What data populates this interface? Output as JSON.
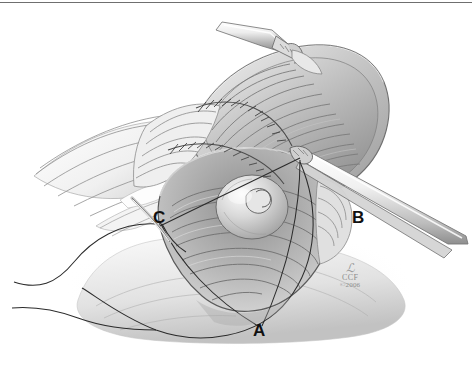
{
  "figure": {
    "style": "grayscale-line-and-wash",
    "background_color": "#ffffff",
    "ink_color": "#1a1a1a",
    "border": {
      "position": "top",
      "color": "#6f6f6f",
      "thickness_px": 1
    }
  },
  "annotations": [
    {
      "id": "A",
      "label": "A",
      "position": "bottom-center"
    },
    {
      "id": "B",
      "label": "B",
      "position": "mid-right"
    },
    {
      "id": "C",
      "label": "C",
      "position": "mid-left"
    }
  ],
  "credit": {
    "monogram": "ℒ",
    "organization": "CCF",
    "copyright": "©2006"
  },
  "elements": {
    "upper_instrument": "surgical-forceps-upper-left",
    "right_instrument": "surgical-forceps-right",
    "flap": "retracted-tissue-flap",
    "suture_line": "running-suture-line",
    "papilla": "central-nipple-valve",
    "mesentery": "mesenteric-folds-left",
    "suture_threads": "triangulating-suture-threads"
  }
}
